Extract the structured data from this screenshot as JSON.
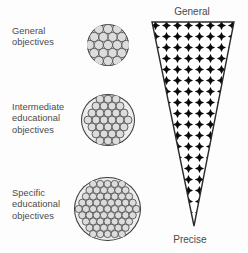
{
  "figure": {
    "background_color": "#fdfdfd",
    "text_color": "#4a4a4a"
  },
  "labels": [
    {
      "id": "general-objectives",
      "text": "General\nobjectives"
    },
    {
      "id": "intermediate-educational-objectives",
      "text": "Intermediate\neducational\nobjectives"
    },
    {
      "id": "specific-educational-objectives",
      "text": "Specific\neducational\nobjectives"
    }
  ],
  "blobs": [
    {
      "id": "blob-general",
      "cell_count": 19,
      "cell_radius": 4.6,
      "granularity": "coarse"
    },
    {
      "id": "blob-intermediate",
      "cell_count": 37,
      "cell_radius": 4.0,
      "granularity": "medium"
    },
    {
      "id": "blob-specific",
      "cell_count": 61,
      "cell_radius": 3.6,
      "granularity": "fine"
    }
  ],
  "cone": {
    "top_label": "General",
    "bottom_label": "Precise",
    "fill_pattern": "black-diamonds",
    "outline_color": "#2b2b2b",
    "pattern_color": "#000000"
  },
  "colors": {
    "cell_fill": "#dcdcdc",
    "cell_stroke": "#555555",
    "blob_outline": "#3a3a3a",
    "background": "#fdfdfd",
    "text": "#4a4a4a"
  }
}
